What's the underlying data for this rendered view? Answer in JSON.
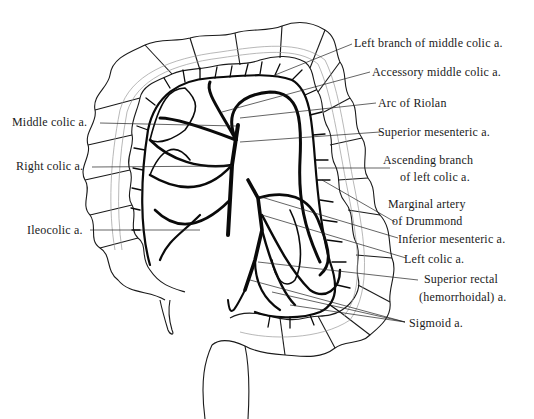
{
  "figure": {
    "labels_right": [
      {
        "id": "left-branch-middle-colic",
        "text": "Left branch of middle colic a."
      },
      {
        "id": "accessory-middle-colic",
        "text": "Accessory middle colic a."
      },
      {
        "id": "arc-of-riolan",
        "text": "Arc of Riolan"
      },
      {
        "id": "superior-mesenteric",
        "text": "Superior mesenteric a."
      },
      {
        "id": "ascending-branch-left-colic-1",
        "text": "Ascending branch"
      },
      {
        "id": "ascending-branch-left-colic-2",
        "text": "of left colic a."
      },
      {
        "id": "marginal-artery-1",
        "text": "Marginal artery"
      },
      {
        "id": "marginal-artery-2",
        "text": "of Drummond"
      },
      {
        "id": "inferior-mesenteric",
        "text": "Inferior mesenteric a."
      },
      {
        "id": "left-colic",
        "text": "Left colic a."
      },
      {
        "id": "superior-rectal-1",
        "text": "Superior rectal"
      },
      {
        "id": "superior-rectal-2",
        "text": "(hemorrhoidal) a."
      },
      {
        "id": "sigmoid",
        "text": "Sigmoid a."
      }
    ],
    "labels_left": [
      {
        "id": "middle-colic",
        "text": "Middle colic a."
      },
      {
        "id": "right-colic",
        "text": "Right colic a."
      },
      {
        "id": "ileocolic",
        "text": "Ileocolic a."
      }
    ],
    "colors": {
      "ink": "#0a0a0a",
      "background": "#ffffff",
      "faint": "#9a9a9a"
    }
  }
}
